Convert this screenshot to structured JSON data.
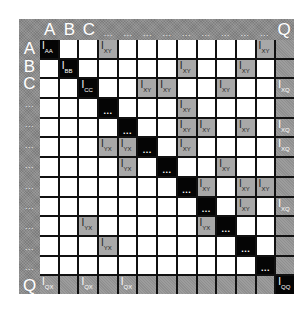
{
  "diagram": {
    "type": "block-matrix",
    "size": 13,
    "colors": {
      "frame": "#8a8a8a",
      "diagonal": "#050505",
      "off_diagonal": "#a8a8a8",
      "empty": "#ffffff",
      "grid_lines": "#111111"
    },
    "column_headers": [
      "A",
      "B",
      "C",
      "...",
      "...",
      "...",
      "...",
      "...",
      "...",
      "...",
      "...",
      "...",
      "Q"
    ],
    "row_headers": [
      "A",
      "B",
      "C",
      "...",
      "...",
      "...",
      "...",
      "...",
      "...",
      "...",
      "...",
      "...",
      "Q"
    ],
    "cells": [
      {
        "r": 0,
        "c": 0,
        "kind": "diag",
        "main": "I",
        "sub": "AA"
      },
      {
        "r": 0,
        "c": 3,
        "kind": "offd",
        "main": "I",
        "sub": "XY"
      },
      {
        "r": 0,
        "c": 11,
        "kind": "offd",
        "main": "I",
        "sub": "XY"
      },
      {
        "r": 1,
        "c": 1,
        "kind": "diag",
        "main": "I",
        "sub": "BB"
      },
      {
        "r": 1,
        "c": 7,
        "kind": "offd",
        "main": "I",
        "sub": "XY"
      },
      {
        "r": 1,
        "c": 10,
        "kind": "offd",
        "main": "I",
        "sub": "XY"
      },
      {
        "r": 2,
        "c": 2,
        "kind": "diag",
        "main": "I",
        "sub": "CC"
      },
      {
        "r": 2,
        "c": 5,
        "kind": "offd",
        "main": "I",
        "sub": "XY"
      },
      {
        "r": 2,
        "c": 6,
        "kind": "offd",
        "main": "I",
        "sub": "XY"
      },
      {
        "r": 2,
        "c": 9,
        "kind": "offd",
        "main": "I",
        "sub": "XY"
      },
      {
        "r": 2,
        "c": 12,
        "kind": "edge",
        "main": "I",
        "sub": "XQ"
      },
      {
        "r": 3,
        "c": 3,
        "kind": "diag",
        "main": "...",
        "sub": ""
      },
      {
        "r": 3,
        "c": 7,
        "kind": "offd",
        "main": "I",
        "sub": "XY"
      },
      {
        "r": 4,
        "c": 4,
        "kind": "diag",
        "main": "...",
        "sub": ""
      },
      {
        "r": 4,
        "c": 7,
        "kind": "offd",
        "main": "I",
        "sub": "XY"
      },
      {
        "r": 4,
        "c": 8,
        "kind": "offd",
        "main": "I",
        "sub": "XY"
      },
      {
        "r": 4,
        "c": 10,
        "kind": "offd",
        "main": "I",
        "sub": "XY"
      },
      {
        "r": 4,
        "c": 12,
        "kind": "edge",
        "main": "I",
        "sub": "XQ"
      },
      {
        "r": 5,
        "c": 3,
        "kind": "offd",
        "main": "I",
        "sub": "YX"
      },
      {
        "r": 5,
        "c": 4,
        "kind": "offd",
        "main": "I",
        "sub": "YX"
      },
      {
        "r": 5,
        "c": 5,
        "kind": "diag",
        "main": "...",
        "sub": ""
      },
      {
        "r": 5,
        "c": 7,
        "kind": "offd",
        "main": "I",
        "sub": "XY"
      },
      {
        "r": 5,
        "c": 12,
        "kind": "edge",
        "main": "I",
        "sub": "XQ"
      },
      {
        "r": 6,
        "c": 4,
        "kind": "offd",
        "main": "I",
        "sub": "YX"
      },
      {
        "r": 6,
        "c": 6,
        "kind": "diag",
        "main": "...",
        "sub": ""
      },
      {
        "r": 6,
        "c": 9,
        "kind": "offd",
        "main": "I",
        "sub": "XY"
      },
      {
        "r": 7,
        "c": 7,
        "kind": "diag",
        "main": "...",
        "sub": ""
      },
      {
        "r": 7,
        "c": 8,
        "kind": "offd",
        "main": "I",
        "sub": "XY"
      },
      {
        "r": 7,
        "c": 10,
        "kind": "offd",
        "main": "I",
        "sub": "XY"
      },
      {
        "r": 7,
        "c": 11,
        "kind": "offd",
        "main": "I",
        "sub": "XY"
      },
      {
        "r": 8,
        "c": 8,
        "kind": "diag",
        "main": "...",
        "sub": ""
      },
      {
        "r": 8,
        "c": 10,
        "kind": "offd",
        "main": "I",
        "sub": "XY"
      },
      {
        "r": 8,
        "c": 12,
        "kind": "edge",
        "main": "I",
        "sub": "XQ"
      },
      {
        "r": 9,
        "c": 2,
        "kind": "offd",
        "main": "I",
        "sub": "YX"
      },
      {
        "r": 9,
        "c": 8,
        "kind": "offd",
        "main": "I",
        "sub": "YX"
      },
      {
        "r": 9,
        "c": 9,
        "kind": "diag",
        "main": "...",
        "sub": ""
      },
      {
        "r": 10,
        "c": 3,
        "kind": "offd",
        "main": "I",
        "sub": "YX"
      },
      {
        "r": 10,
        "c": 10,
        "kind": "diag",
        "main": "...",
        "sub": ""
      },
      {
        "r": 11,
        "c": 11,
        "kind": "diag",
        "main": "...",
        "sub": ""
      },
      {
        "r": 12,
        "c": 0,
        "kind": "edge",
        "main": "I",
        "sub": "QX"
      },
      {
        "r": 12,
        "c": 2,
        "kind": "edge",
        "main": "I",
        "sub": "QX"
      },
      {
        "r": 12,
        "c": 4,
        "kind": "edge",
        "main": "I",
        "sub": "QX"
      },
      {
        "r": 12,
        "c": 12,
        "kind": "diag",
        "main": "I",
        "sub": "QQ"
      }
    ],
    "edge_row": 12,
    "edge_col": 12
  }
}
